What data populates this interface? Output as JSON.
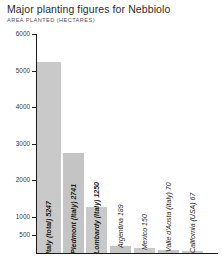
{
  "chart_data": {
    "type": "bar",
    "title": "Major planting figures for Nebbiolo",
    "subtitle": "AREA PLANTED (HECTARES)",
    "xlabel": "",
    "ylabel": "AREA PLANTED (HECTARES)",
    "ylim": [
      0,
      6000
    ],
    "grid": false,
    "legend": "none",
    "categories": [
      "Italy (total)",
      "Piedmont (Italy)",
      "Lombardy (Italy)",
      "Argentina",
      "Mexico",
      "Valle d'Aosta (Italy)",
      "California (USA)"
    ],
    "values": [
      5247,
      2741,
      1250,
      189,
      150,
      70,
      67
    ],
    "bar_labels": [
      "Italy (total) 5247",
      "Piedmont (Italy) 2741",
      "Lombardy (Italy) 1250",
      "Argentina 189",
      "Mexico 150",
      "Valle d'Aosta (Italy) 70",
      "California (USA) 67"
    ],
    "y_ticks": [
      6000,
      5000,
      4000,
      3000,
      2000,
      1000,
      500
    ],
    "y_tick_labels": [
      "6000",
      "5000",
      "4000",
      "3000",
      "2000",
      "1000",
      "500"
    ],
    "bar_color": "#c9c9c9",
    "axis_color": "#1a1a1a",
    "title_color": "#2b2b2b"
  }
}
